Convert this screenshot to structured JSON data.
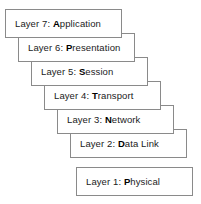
{
  "diagram": {
    "style": {
      "border_color": "#8a8a8a",
      "text_color": "#1b1b1b",
      "bold_text_color": "#000000",
      "background_color": "#ffffff"
    },
    "layers": [
      {
        "number": "7",
        "prefix": "Layer 7: ",
        "bold_initial": "A",
        "rest": "pplication",
        "full_label": "Layer 7: Application",
        "left": 5,
        "top": 9,
        "width": 117,
        "height": 29
      },
      {
        "number": "6",
        "prefix": "Layer 6: ",
        "bold_initial": "P",
        "rest": "resentation",
        "full_label": "Layer 6: Presentation",
        "left": 18,
        "top": 33,
        "width": 117,
        "height": 29
      },
      {
        "number": "5",
        "prefix": "Layer 5: ",
        "bold_initial": "S",
        "rest": "ession",
        "full_label": "Layer 5: Session",
        "left": 31,
        "top": 57,
        "width": 117,
        "height": 29
      },
      {
        "number": "4",
        "prefix": "Layer 4: ",
        "bold_initial": "T",
        "rest": "ransport",
        "full_label": "Layer 4: Transport",
        "left": 44,
        "top": 81,
        "width": 117,
        "height": 29
      },
      {
        "number": "3",
        "prefix": "Layer 3: ",
        "bold_initial": "N",
        "rest": "etwork",
        "full_label": "Layer 3: Network",
        "left": 57,
        "top": 105,
        "width": 117,
        "height": 29
      },
      {
        "number": "2",
        "prefix": "Layer 2: ",
        "bold_initial": "D",
        "rest": "ata Link",
        "full_label": "Layer 2: Data Link",
        "left": 70,
        "top": 129,
        "width": 117,
        "height": 29
      },
      {
        "number": "1",
        "prefix": "Layer 1: ",
        "bold_initial": "P",
        "rest": "hysical",
        "full_label": "Layer 1: Physical",
        "left": 76,
        "top": 167,
        "width": 117,
        "height": 29
      }
    ]
  }
}
